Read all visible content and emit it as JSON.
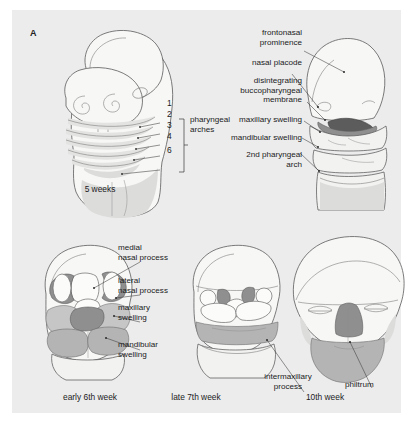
{
  "figure": {
    "panel_letter": "A",
    "background_color": "#ececed",
    "page_background": "#ffffff"
  },
  "palette": {
    "outline": "#5a5a5a",
    "pale_tissue": "#f7f7f6",
    "light_shade": "#e3e3e2",
    "medium_swelling": "#b4b4b4",
    "light_swelling": "#c6c6c6",
    "dark_swelling": "#8f8f8f",
    "very_dark_membrane": "#5c5c5c",
    "leader_line": "#3b3b3b",
    "text": "#1b1b1b"
  },
  "top_left": {
    "caption": "5 weeks",
    "arch_numbers": [
      "1",
      "2",
      "3",
      "4",
      "6"
    ],
    "bracket_label_line1": "pharyngeal",
    "bracket_label_line2": "arches",
    "bracket_label": "pharyngeal\narches"
  },
  "top_right": {
    "labels": [
      {
        "id": "frontonasal-prominence",
        "text": "frontonasal\nprominence"
      },
      {
        "id": "nasal-placode",
        "text": "nasal placode"
      },
      {
        "id": "disintegrating-buccopharyngeal-membrane",
        "text": "disintegrating\nbuccopharyngeal\nmembrane"
      },
      {
        "id": "maxillary-swelling",
        "text": "maxillary swelling"
      },
      {
        "id": "mandibular-swelling",
        "text": "mandibular swelling"
      },
      {
        "id": "second-pharyngeal-arch",
        "text": "2nd pharyngeal\narch"
      }
    ]
  },
  "bottom_left": {
    "caption": "early 6th week",
    "labels": [
      {
        "id": "medial-nasal-process",
        "text": "medial\nnasal process"
      },
      {
        "id": "lateral-nasal-process",
        "text": "lateral\nnasal process"
      },
      {
        "id": "maxillary-swelling",
        "text": "maxillary\nswelling"
      },
      {
        "id": "mandibular-swelling",
        "text": "mandibular\nswelling"
      }
    ]
  },
  "bottom_middle": {
    "caption": "late 7th week",
    "labels": [
      {
        "id": "intermaxillary-process",
        "text": "intermaxillary\nprocess"
      }
    ]
  },
  "bottom_right": {
    "caption": "10th week",
    "labels": [
      {
        "id": "philtrum",
        "text": "philtrum"
      }
    ]
  }
}
